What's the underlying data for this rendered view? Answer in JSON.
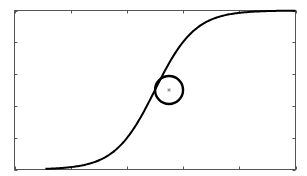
{
  "chart_data": {
    "type": "line",
    "title": "",
    "xlabel": "",
    "ylabel": "",
    "xlim": [
      0,
      5
    ],
    "ylim": [
      0,
      1
    ],
    "grid": false,
    "legend": null,
    "x_ticks": [
      0,
      1,
      2,
      3,
      4,
      5
    ],
    "y_ticks": [
      0,
      0.2,
      0.4,
      0.6,
      0.8,
      1.0
    ],
    "tick_labels_visible": false,
    "series": [
      {
        "name": "sigmoid",
        "color": "#000000",
        "function": "logistic",
        "center": 2.5,
        "steepness": 2.8,
        "x": [
          0.55,
          1.0,
          1.5,
          2.0,
          2.25,
          2.5,
          2.75,
          3.0,
          3.5,
          4.0,
          4.5,
          5.0
        ],
        "values": [
          0.004,
          0.015,
          0.057,
          0.198,
          0.332,
          0.5,
          0.668,
          0.802,
          0.943,
          0.985,
          0.996,
          0.999
        ]
      }
    ],
    "annotations": [
      {
        "type": "circle",
        "center": [
          2.75,
          0.5
        ],
        "radius_px": 14,
        "color": "#000000"
      },
      {
        "type": "marker",
        "shape": "star",
        "position": [
          2.75,
          0.5
        ],
        "color": "#888888"
      }
    ]
  }
}
